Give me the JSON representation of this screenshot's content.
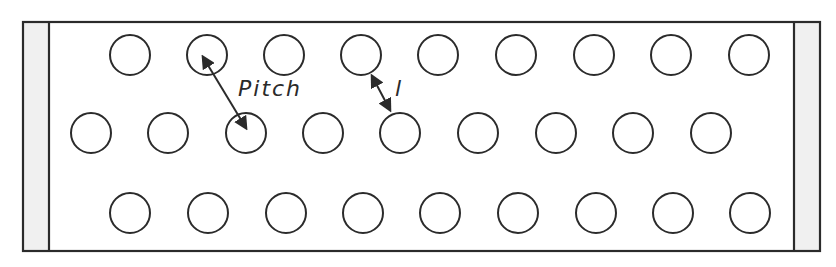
{
  "diagram": {
    "labels": {
      "pitch": "Pitch",
      "ligament": "l"
    },
    "colors": {
      "stroke": "#2b2b2b",
      "end_strip_fill": "#f0f0f0",
      "background": "#ffffff"
    },
    "plate": {
      "x": 23,
      "y": 22,
      "width": 797,
      "height": 229
    },
    "end_strips": [
      {
        "side": "left",
        "x": 23,
        "width": 26
      },
      {
        "side": "right",
        "x": 794,
        "width": 26
      }
    ],
    "hole_radius": 20,
    "rows": [
      {
        "y": 55,
        "x": [
          130,
          207,
          284,
          361,
          438,
          516,
          594,
          671,
          749
        ]
      },
      {
        "y": 133,
        "x": [
          91,
          168,
          246,
          323,
          400,
          478,
          556,
          633,
          711
        ]
      },
      {
        "y": 213,
        "x": [
          130,
          208,
          286,
          363,
          440,
          518,
          596,
          673,
          750
        ]
      }
    ],
    "arrows": [
      {
        "name": "pitch-arrow",
        "x1": 203,
        "y1": 57,
        "x2": 246,
        "y2": 128
      },
      {
        "name": "ligament-arrow",
        "x1": 372,
        "y1": 76,
        "x2": 390,
        "y2": 110
      }
    ]
  }
}
